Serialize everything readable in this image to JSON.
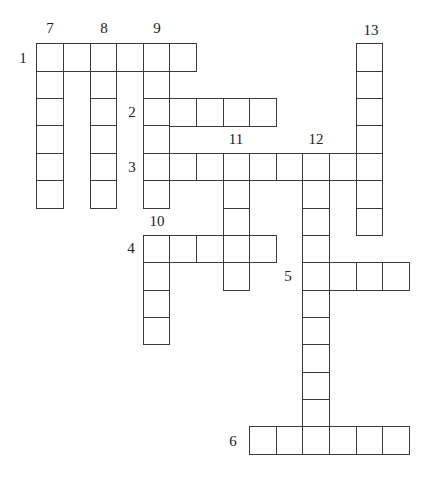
{
  "puzzle": {
    "grid": {
      "origin_x": 37,
      "origin_y": 44,
      "cell_w": 26.6,
      "cell_h": 27.36,
      "border_color": "#3a3a3a",
      "background": "#ffffff"
    },
    "entries": [
      {
        "number": "1",
        "direction": "across",
        "row": 0,
        "col": 0,
        "length": 6
      },
      {
        "number": "2",
        "direction": "across",
        "row": 2,
        "col": 4,
        "length": 5
      },
      {
        "number": "3",
        "direction": "across",
        "row": 4,
        "col": 4,
        "length": 9
      },
      {
        "number": "4",
        "direction": "across",
        "row": 7,
        "col": 4,
        "length": 5
      },
      {
        "number": "5",
        "direction": "across",
        "row": 8,
        "col": 10,
        "length": 4
      },
      {
        "number": "6",
        "direction": "across",
        "row": 14,
        "col": 8,
        "length": 6
      },
      {
        "number": "7",
        "direction": "down",
        "row": 0,
        "col": 0,
        "length": 6
      },
      {
        "number": "8",
        "direction": "down",
        "row": 0,
        "col": 2,
        "length": 6
      },
      {
        "number": "9",
        "direction": "down",
        "row": 0,
        "col": 4,
        "length": 6
      },
      {
        "number": "10",
        "direction": "down",
        "row": 7,
        "col": 4,
        "length": 4
      },
      {
        "number": "11",
        "direction": "down",
        "row": 4,
        "col": 7,
        "length": 5
      },
      {
        "number": "12",
        "direction": "down",
        "row": 4,
        "col": 10,
        "length": 11
      },
      {
        "number": "13",
        "direction": "down",
        "row": 0,
        "col": 12,
        "length": 7
      }
    ],
    "labels": [
      {
        "text": "1",
        "x": 23,
        "y": 58
      },
      {
        "text": "7",
        "x": 50,
        "y": 28
      },
      {
        "text": "8",
        "x": 104,
        "y": 28
      },
      {
        "text": "9",
        "x": 157,
        "y": 28
      },
      {
        "text": "13",
        "x": 371,
        "y": 30
      },
      {
        "text": "2",
        "x": 132,
        "y": 112
      },
      {
        "text": "3",
        "x": 132,
        "y": 167
      },
      {
        "text": "11",
        "x": 236,
        "y": 139
      },
      {
        "text": "12",
        "x": 316,
        "y": 139
      },
      {
        "text": "10",
        "x": 157,
        "y": 221
      },
      {
        "text": "4",
        "x": 131,
        "y": 248
      },
      {
        "text": "5",
        "x": 288,
        "y": 276
      },
      {
        "text": "6",
        "x": 233,
        "y": 441
      }
    ]
  }
}
